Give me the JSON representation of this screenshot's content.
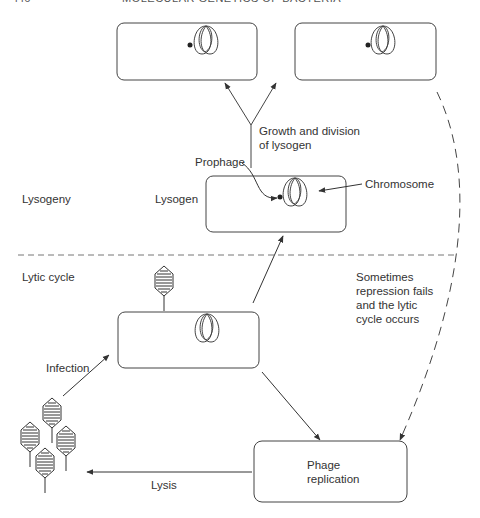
{
  "running_head": {
    "page_number": "446",
    "title": "MOLECULAR GENETICS OF BACTERIA"
  },
  "diagram": {
    "type": "bacteriophage lambda life cycle",
    "sections": {
      "lysogeny": "Lysogeny",
      "lytic_cycle": "Lytic cycle"
    },
    "nodes": {
      "daughter_lysogen_left": {
        "label": "",
        "contains": "chromosome with integrated prophage"
      },
      "daughter_lysogen_right": {
        "label": "",
        "contains": "chromosome with integrated prophage"
      },
      "lysogen": {
        "label": "Lysogen",
        "contains": "chromosome with integrated prophage"
      },
      "infected_cell": {
        "label": "",
        "contains": "chromosome, attached phage"
      },
      "phage_replication": {
        "label_line1": "Phage",
        "label_line2": "replication"
      },
      "free_phages": {
        "count": 4
      }
    },
    "annotations": {
      "prophage": "Prophage",
      "chromosome": "Chromosome",
      "growth_line1": "Growth and division",
      "growth_line2": "of lysogen",
      "sometimes_line1": "Sometimes",
      "sometimes_line2": "repression fails",
      "sometimes_line3": "and the lytic",
      "sometimes_line4": "cycle occurs",
      "infection": "Infection",
      "lysis": "Lysis"
    },
    "edges": [
      {
        "from": "free_phages",
        "to": "infected_cell",
        "label": "Infection",
        "style": "solid"
      },
      {
        "from": "infected_cell",
        "to": "lysogen",
        "label": "",
        "style": "solid"
      },
      {
        "from": "infected_cell",
        "to": "phage_replication",
        "label": "",
        "style": "solid"
      },
      {
        "from": "lysogen",
        "to": "daughter_lysogens",
        "label": "Growth and division of lysogen",
        "style": "solid-branching"
      },
      {
        "from": "daughter_lysogen_right",
        "to": "phage_replication",
        "label": "Sometimes repression fails and the lytic cycle occurs",
        "style": "dashed"
      },
      {
        "from": "phage_replication",
        "to": "free_phages",
        "label": "Lysis",
        "style": "solid"
      }
    ]
  }
}
